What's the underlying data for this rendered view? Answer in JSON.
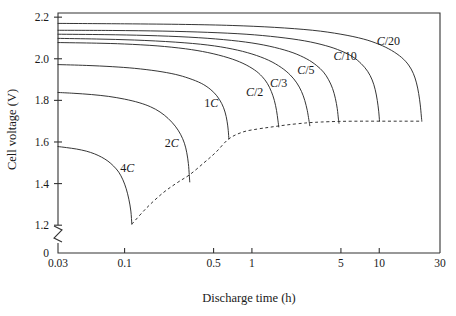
{
  "chart_data": {
    "type": "line",
    "title": "",
    "xlabel": "Discharge time (h)",
    "ylabel": "Cell voltage (V)",
    "xscale": "log",
    "xlim": [
      0.03,
      30
    ],
    "ylim": [
      1.1,
      2.22
    ],
    "yaxis_broken": true,
    "yaxis_break_label": "0",
    "grid": false,
    "legend": "inline-labels",
    "xticks": [
      {
        "value": 0.03,
        "label": "0.03"
      },
      {
        "value": 0.1,
        "label": "0.1"
      },
      {
        "value": 0.5,
        "label": "0.5"
      },
      {
        "value": 1,
        "label": "1"
      },
      {
        "value": 5,
        "label": "5"
      },
      {
        "value": 10,
        "label": "10"
      },
      {
        "value": 30,
        "label": "30"
      }
    ],
    "yticks": [
      {
        "value": 1.2,
        "label": "1.2"
      },
      {
        "value": 1.4,
        "label": "1.4"
      },
      {
        "value": 1.6,
        "label": "1.6"
      },
      {
        "value": 1.8,
        "label": "1.8"
      },
      {
        "value": 2.0,
        "label": "2.0"
      },
      {
        "value": 2.2,
        "label": "2.2"
      }
    ],
    "series": [
      {
        "name": "4C",
        "label_prefix": "4",
        "label_italic": "C",
        "label_at": {
          "x": 0.105,
          "y": 1.455
        },
        "points": [
          [
            0.03,
            1.578
          ],
          [
            0.035,
            1.573
          ],
          [
            0.042,
            1.566
          ],
          [
            0.05,
            1.556
          ],
          [
            0.058,
            1.543
          ],
          [
            0.066,
            1.527
          ],
          [
            0.074,
            1.508
          ],
          [
            0.082,
            1.484
          ],
          [
            0.09,
            1.455
          ],
          [
            0.097,
            1.418
          ],
          [
            0.103,
            1.375
          ],
          [
            0.108,
            1.325
          ],
          [
            0.112,
            1.268
          ],
          [
            0.114,
            1.205
          ]
        ]
      },
      {
        "name": "2C",
        "label_prefix": "2",
        "label_italic": "C",
        "label_at": {
          "x": 0.235,
          "y": 1.575
        },
        "points": [
          [
            0.03,
            1.838
          ],
          [
            0.04,
            1.834
          ],
          [
            0.055,
            1.828
          ],
          [
            0.075,
            1.819
          ],
          [
            0.1,
            1.806
          ],
          [
            0.13,
            1.789
          ],
          [
            0.16,
            1.769
          ],
          [
            0.19,
            1.744
          ],
          [
            0.22,
            1.713
          ],
          [
            0.25,
            1.676
          ],
          [
            0.275,
            1.637
          ],
          [
            0.295,
            1.594
          ],
          [
            0.308,
            1.548
          ],
          [
            0.317,
            1.496
          ],
          [
            0.322,
            1.443
          ],
          [
            0.325,
            1.408
          ]
        ]
      },
      {
        "name": "1C",
        "label_prefix": "1",
        "label_italic": "C",
        "label_at": {
          "x": 0.48,
          "y": 1.768
        },
        "points": [
          [
            0.03,
            1.972
          ],
          [
            0.05,
            1.968
          ],
          [
            0.08,
            1.962
          ],
          [
            0.12,
            1.954
          ],
          [
            0.18,
            1.941
          ],
          [
            0.25,
            1.925
          ],
          [
            0.32,
            1.906
          ],
          [
            0.4,
            1.882
          ],
          [
            0.47,
            1.854
          ],
          [
            0.53,
            1.822
          ],
          [
            0.58,
            1.784
          ],
          [
            0.615,
            1.744
          ],
          [
            0.638,
            1.7
          ],
          [
            0.652,
            1.655
          ],
          [
            0.659,
            1.615
          ]
        ]
      },
      {
        "name": "C/2",
        "label_prefix": "",
        "label_italic": "C",
        "label_suffix": "/2",
        "label_at": {
          "x": 1.05,
          "y": 1.82
        },
        "points": [
          [
            0.03,
            2.078
          ],
          [
            0.06,
            2.075
          ],
          [
            0.1,
            2.071
          ],
          [
            0.18,
            2.062
          ],
          [
            0.3,
            2.048
          ],
          [
            0.45,
            2.03
          ],
          [
            0.65,
            2.005
          ],
          [
            0.85,
            1.978
          ],
          [
            1.05,
            1.946
          ],
          [
            1.2,
            1.915
          ],
          [
            1.32,
            1.882
          ],
          [
            1.42,
            1.843
          ],
          [
            1.5,
            1.8
          ],
          [
            1.56,
            1.752
          ],
          [
            1.6,
            1.705
          ],
          [
            1.625,
            1.672
          ]
        ]
      },
      {
        "name": "C/3",
        "label_prefix": "",
        "label_italic": "C",
        "label_suffix": "/3",
        "label_at": {
          "x": 1.62,
          "y": 1.862
        },
        "points": [
          [
            0.03,
            2.098
          ],
          [
            0.06,
            2.095
          ],
          [
            0.12,
            2.09
          ],
          [
            0.25,
            2.08
          ],
          [
            0.45,
            2.066
          ],
          [
            0.7,
            2.047
          ],
          [
            1.0,
            2.023
          ],
          [
            1.35,
            1.993
          ],
          [
            1.7,
            1.958
          ],
          [
            2.0,
            1.922
          ],
          [
            2.25,
            1.884
          ],
          [
            2.45,
            1.843
          ],
          [
            2.6,
            1.8
          ],
          [
            2.72,
            1.752
          ],
          [
            2.8,
            1.707
          ],
          [
            2.85,
            1.678
          ]
        ]
      },
      {
        "name": "C/5",
        "label_prefix": "",
        "label_italic": "C",
        "label_suffix": "/5",
        "label_at": {
          "x": 2.65,
          "y": 1.925
        },
        "points": [
          [
            0.03,
            2.118
          ],
          [
            0.07,
            2.116
          ],
          [
            0.15,
            2.112
          ],
          [
            0.32,
            2.104
          ],
          [
            0.6,
            2.092
          ],
          [
            1.0,
            2.076
          ],
          [
            1.5,
            2.055
          ],
          [
            2.1,
            2.029
          ],
          [
            2.7,
            1.999
          ],
          [
            3.2,
            1.969
          ],
          [
            3.65,
            1.936
          ],
          [
            4.0,
            1.899
          ],
          [
            4.3,
            1.857
          ],
          [
            4.52,
            1.81
          ],
          [
            4.68,
            1.76
          ],
          [
            4.78,
            1.71
          ],
          [
            4.83,
            1.69
          ]
        ]
      },
      {
        "name": "C/10",
        "label_prefix": "",
        "label_italic": "C",
        "label_suffix": "/10",
        "label_at": {
          "x": 5.4,
          "y": 1.995
        },
        "points": [
          [
            0.03,
            2.137
          ],
          [
            0.08,
            2.136
          ],
          [
            0.2,
            2.133
          ],
          [
            0.45,
            2.127
          ],
          [
            0.9,
            2.118
          ],
          [
            1.6,
            2.104
          ],
          [
            2.6,
            2.086
          ],
          [
            3.8,
            2.063
          ],
          [
            5.0,
            2.038
          ],
          [
            6.2,
            2.009
          ],
          [
            7.2,
            1.977
          ],
          [
            8.1,
            1.94
          ],
          [
            8.8,
            1.898
          ],
          [
            9.3,
            1.851
          ],
          [
            9.65,
            1.8
          ],
          [
            9.9,
            1.748
          ],
          [
            10.05,
            1.7
          ]
        ]
      },
      {
        "name": "C/20",
        "label_prefix": "",
        "label_italic": "C",
        "label_suffix": "/20",
        "label_at": {
          "x": 11.8,
          "y": 2.065
        },
        "points": [
          [
            0.03,
            2.17
          ],
          [
            0.1,
            2.168
          ],
          [
            0.3,
            2.165
          ],
          [
            0.7,
            2.16
          ],
          [
            1.5,
            2.151
          ],
          [
            3.0,
            2.137
          ],
          [
            5.0,
            2.118
          ],
          [
            7.5,
            2.095
          ],
          [
            10.0,
            2.069
          ],
          [
            12.5,
            2.04
          ],
          [
            15.0,
            2.006
          ],
          [
            17.0,
            1.97
          ],
          [
            18.5,
            1.93
          ],
          [
            19.6,
            1.884
          ],
          [
            20.4,
            1.833
          ],
          [
            21.0,
            1.778
          ],
          [
            21.4,
            1.725
          ],
          [
            21.6,
            1.7
          ]
        ]
      }
    ],
    "cutoff_curve": {
      "name": "discharge-cutoff-envelope",
      "style": "dashed",
      "points": [
        [
          0.114,
          1.205
        ],
        [
          0.15,
          1.285
        ],
        [
          0.2,
          1.355
        ],
        [
          0.26,
          1.405
        ],
        [
          0.325,
          1.443
        ],
        [
          0.42,
          1.5
        ],
        [
          0.52,
          1.55
        ],
        [
          0.659,
          1.615
        ],
        [
          0.85,
          1.648
        ],
        [
          1.1,
          1.662
        ],
        [
          1.35,
          1.67
        ],
        [
          1.625,
          1.677
        ],
        [
          2.0,
          1.684
        ],
        [
          2.5,
          1.69
        ],
        [
          2.85,
          1.693
        ],
        [
          3.5,
          1.696
        ],
        [
          4.83,
          1.699
        ],
        [
          7.0,
          1.7
        ],
        [
          10.05,
          1.7
        ],
        [
          15.0,
          1.7
        ],
        [
          21.6,
          1.7
        ]
      ]
    }
  }
}
